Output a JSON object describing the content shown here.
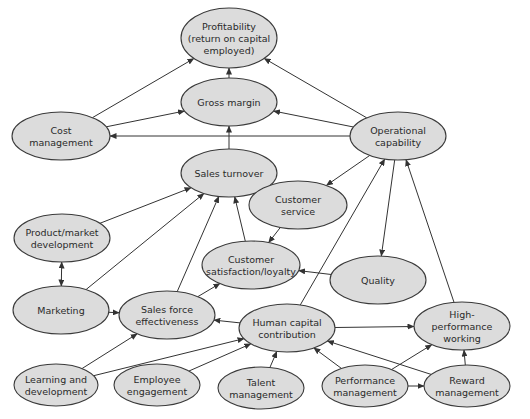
{
  "diagram": {
    "style": {
      "node_fill": "#dcdcdc",
      "node_stroke": "#3a3a3a",
      "edge_color": "#333333",
      "background": "#ffffff"
    },
    "nodes": [
      {
        "id": "profitability",
        "lines": [
          "Profitability",
          "(return on capital",
          "employed)"
        ],
        "cx": 229,
        "cy": 38,
        "rx": 48,
        "ry": 30
      },
      {
        "id": "gross_margin",
        "lines": [
          "Gross margin"
        ],
        "cx": 229,
        "cy": 102,
        "rx": 48,
        "ry": 24
      },
      {
        "id": "cost_management",
        "lines": [
          "Cost",
          "management"
        ],
        "cx": 61,
        "cy": 136,
        "rx": 49,
        "ry": 24
      },
      {
        "id": "operational_capability",
        "lines": [
          "Operational",
          "capability"
        ],
        "cx": 398,
        "cy": 136,
        "rx": 48,
        "ry": 24
      },
      {
        "id": "sales_turnover",
        "lines": [
          "Sales turnover"
        ],
        "cx": 229,
        "cy": 173,
        "rx": 48,
        "ry": 24
      },
      {
        "id": "customer_service",
        "lines": [
          "Customer",
          "service"
        ],
        "cx": 298,
        "cy": 205,
        "rx": 49,
        "ry": 24
      },
      {
        "id": "product_market_development",
        "lines": [
          "Product/market",
          "development"
        ],
        "cx": 62,
        "cy": 238,
        "rx": 48,
        "ry": 24
      },
      {
        "id": "customer_satisfaction",
        "lines": [
          "Customer",
          "satisfaction/loyalty"
        ],
        "cx": 251,
        "cy": 265,
        "rx": 49,
        "ry": 24
      },
      {
        "id": "quality",
        "lines": [
          "Quality"
        ],
        "cx": 378,
        "cy": 280,
        "rx": 48,
        "ry": 24
      },
      {
        "id": "marketing",
        "lines": [
          "Marketing"
        ],
        "cx": 61,
        "cy": 310,
        "rx": 48,
        "ry": 24
      },
      {
        "id": "sales_force_effectiveness",
        "lines": [
          "Sales force",
          "effectiveness"
        ],
        "cx": 167,
        "cy": 315,
        "rx": 48,
        "ry": 24
      },
      {
        "id": "human_capital_contribution",
        "lines": [
          "Human capital",
          "contribution"
        ],
        "cx": 287,
        "cy": 328,
        "rx": 48,
        "ry": 24
      },
      {
        "id": "high_performance_working",
        "lines": [
          "High-",
          "performance",
          "working"
        ],
        "cx": 462,
        "cy": 326,
        "rx": 48,
        "ry": 24
      },
      {
        "id": "learning_development",
        "lines": [
          "Learning and",
          "development"
        ],
        "cx": 56,
        "cy": 385,
        "rx": 42,
        "ry": 21
      },
      {
        "id": "employee_engagement",
        "lines": [
          "Employee",
          "engagement"
        ],
        "cx": 157,
        "cy": 385,
        "rx": 43,
        "ry": 21
      },
      {
        "id": "talent_management",
        "lines": [
          "Talent",
          "management"
        ],
        "cx": 261,
        "cy": 388,
        "rx": 43,
        "ry": 21
      },
      {
        "id": "performance_management",
        "lines": [
          "Performance",
          "management"
        ],
        "cx": 365,
        "cy": 386,
        "rx": 43,
        "ry": 21
      },
      {
        "id": "reward_management",
        "lines": [
          "Reward",
          "management"
        ],
        "cx": 467,
        "cy": 386,
        "rx": 43,
        "ry": 21
      }
    ],
    "edges": [
      {
        "from": "gross_margin",
        "to": "profitability"
      },
      {
        "from": "cost_management",
        "to": "profitability"
      },
      {
        "from": "operational_capability",
        "to": "profitability"
      },
      {
        "from": "cost_management",
        "to": "gross_margin"
      },
      {
        "from": "operational_capability",
        "to": "gross_margin"
      },
      {
        "from": "operational_capability",
        "to": "cost_management"
      },
      {
        "from": "sales_turnover",
        "to": "gross_margin"
      },
      {
        "from": "product_market_development",
        "to": "sales_turnover"
      },
      {
        "from": "marketing",
        "to": "sales_turnover"
      },
      {
        "from": "sales_force_effectiveness",
        "to": "sales_turnover"
      },
      {
        "from": "customer_satisfaction",
        "to": "sales_turnover"
      },
      {
        "from": "operational_capability",
        "to": "customer_service"
      },
      {
        "from": "operational_capability",
        "to": "quality"
      },
      {
        "from": "customer_service",
        "to": "customer_satisfaction"
      },
      {
        "from": "quality",
        "to": "customer_satisfaction"
      },
      {
        "from": "product_market_development",
        "to": "marketing",
        "bidirectional": true
      },
      {
        "from": "marketing",
        "to": "sales_force_effectiveness"
      },
      {
        "from": "sales_force_effectiveness",
        "to": "customer_satisfaction"
      },
      {
        "from": "human_capital_contribution",
        "to": "sales_force_effectiveness"
      },
      {
        "from": "human_capital_contribution",
        "to": "operational_capability"
      },
      {
        "from": "high_performance_working",
        "to": "operational_capability"
      },
      {
        "from": "human_capital_contribution",
        "to": "high_performance_working"
      },
      {
        "from": "learning_development",
        "to": "sales_force_effectiveness"
      },
      {
        "from": "learning_development",
        "to": "human_capital_contribution"
      },
      {
        "from": "employee_engagement",
        "to": "human_capital_contribution"
      },
      {
        "from": "talent_management",
        "to": "human_capital_contribution"
      },
      {
        "from": "performance_management",
        "to": "human_capital_contribution"
      },
      {
        "from": "performance_management",
        "to": "high_performance_working"
      },
      {
        "from": "performance_management",
        "to": "reward_management"
      },
      {
        "from": "reward_management",
        "to": "human_capital_contribution"
      },
      {
        "from": "reward_management",
        "to": "high_performance_working"
      }
    ]
  }
}
